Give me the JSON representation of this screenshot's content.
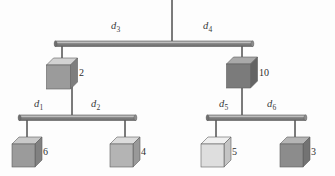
{
  "figure": {
    "background_color": "#fdfdfd",
    "bar_color": "#8a8a8a",
    "bar_edge_color": "#5a5a5a",
    "wire_color": "#6f6f6f",
    "text_color": "#3a3a3a"
  },
  "support": {
    "name": "ceiling-support-wire",
    "x": 172,
    "y_top": 0,
    "y_bottom": 42
  },
  "beams": [
    {
      "id": "top-beam",
      "label": "top beam",
      "x_left": 55,
      "x_right": 253,
      "y": 41,
      "pivot_x": 172,
      "left_attach_x": 62,
      "right_attach_x": 242
    },
    {
      "id": "left-beam",
      "label": "left lower beam",
      "x_left": 19,
      "x_right": 136,
      "y": 115,
      "pivot_x": 72,
      "left_attach_x": 27,
      "right_attach_x": 125
    },
    {
      "id": "right-beam",
      "label": "right lower beam",
      "x_left": 207,
      "x_right": 306,
      "y": 115,
      "pivot_x": 242,
      "left_attach_x": 216,
      "right_attach_x": 295
    }
  ],
  "distance_labels": [
    {
      "id": "d1",
      "base": "d",
      "sub": "1",
      "x": 34,
      "y": 99,
      "beam": "left-beam",
      "side": "left"
    },
    {
      "id": "d2",
      "base": "d",
      "sub": "2",
      "x": 91,
      "y": 99,
      "beam": "left-beam",
      "side": "right"
    },
    {
      "id": "d3",
      "base": "d",
      "sub": "3",
      "x": 111,
      "y": 21,
      "beam": "top-beam",
      "side": "left"
    },
    {
      "id": "d4",
      "base": "d",
      "sub": "4",
      "x": 203,
      "y": 21,
      "beam": "top-beam",
      "side": "right"
    },
    {
      "id": "d5",
      "base": "d",
      "sub": "5",
      "x": 219,
      "y": 99,
      "beam": "right-beam",
      "side": "left"
    },
    {
      "id": "d6",
      "base": "d",
      "sub": "6",
      "x": 267,
      "y": 99,
      "beam": "right-beam",
      "side": "right"
    }
  ],
  "blocks": [
    {
      "id": "block-2",
      "mass_label": "2",
      "center_x": 62,
      "top_y": 58,
      "size": 24,
      "depth": 7,
      "front_color": "#9b9b9b",
      "top_color": "#d2d2d2",
      "side_color": "#7e7e7e",
      "label_x": 79,
      "label_y": 68,
      "hangs_from": "top-beam",
      "supports": "left-beam"
    },
    {
      "id": "block-10",
      "mass_label": "10",
      "center_x": 242,
      "top_y": 57,
      "size": 24,
      "depth": 7,
      "front_color": "#7b7b7b",
      "top_color": "#a9a9a9",
      "side_color": "#646464",
      "label_x": 259,
      "label_y": 68,
      "hangs_from": "top-beam",
      "supports": "right-beam"
    },
    {
      "id": "block-6",
      "mass_label": "6",
      "center_x": 27,
      "top_y": 137,
      "size": 23,
      "depth": 7,
      "front_color": "#9b9b9b",
      "top_color": "#c9c9c9",
      "side_color": "#818181",
      "label_x": 43,
      "label_y": 147,
      "hangs_from": "left-beam"
    },
    {
      "id": "block-4",
      "mass_label": "4",
      "center_x": 125,
      "top_y": 137,
      "size": 23,
      "depth": 7,
      "front_color": "#b4b4b4",
      "top_color": "#dcdcdc",
      "side_color": "#999999",
      "label_x": 141,
      "label_y": 147,
      "hangs_from": "left-beam"
    },
    {
      "id": "block-5",
      "mass_label": "5",
      "center_x": 216,
      "top_y": 137,
      "size": 23,
      "depth": 7,
      "front_color": "#dedede",
      "top_color": "#f0f0f0",
      "side_color": "#c4c4c4",
      "label_x": 232,
      "label_y": 147,
      "hangs_from": "right-beam"
    },
    {
      "id": "block-3",
      "mass_label": "3",
      "center_x": 295,
      "top_y": 137,
      "size": 23,
      "depth": 7,
      "front_color": "#8c8c8c",
      "top_color": "#b5b5b5",
      "side_color": "#737373",
      "label_x": 311,
      "label_y": 147,
      "hangs_from": "right-beam"
    }
  ]
}
